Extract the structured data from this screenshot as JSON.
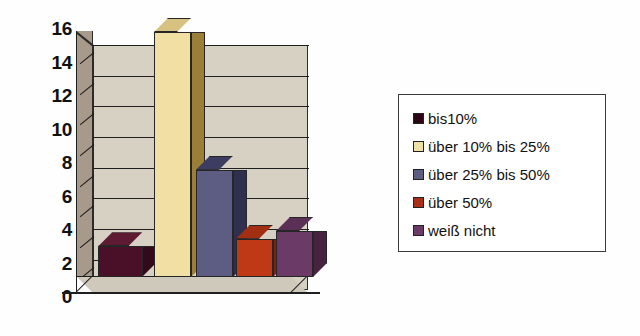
{
  "chart_data": {
    "type": "bar",
    "title": "",
    "subtitle": "",
    "xlabel": "",
    "ylabel": "",
    "ylim": [
      0,
      16
    ],
    "grid": true,
    "style": "3d-bar",
    "legend_position": "right",
    "categories": [
      "bis10%",
      "über 10% bis 25%",
      "über 25% bis 50%",
      "über 50%",
      "weiß nicht"
    ],
    "values": [
      2,
      16,
      7,
      2.5,
      3
    ],
    "yticks": [
      16,
      14,
      12,
      10,
      8,
      6,
      4,
      2,
      0
    ],
    "ytick_labels": [
      "16",
      "14",
      "12",
      "10",
      "8",
      "6",
      "4",
      "2",
      "0"
    ],
    "xtick_labels": [],
    "series": [
      {
        "name": "Anteil",
        "values": [
          2,
          16,
          7,
          2.5,
          3
        ]
      }
    ],
    "bar_colors": [
      "#4a1028",
      "#f1dfa4",
      "#5d5d84",
      "#bf3917",
      "#6b3a66"
    ],
    "bar_side_colors": [
      "#33091b",
      "#9c7f36",
      "#2f3050",
      "#7f2410",
      "#472340"
    ],
    "bar_top_colors": [
      "#5e1a33",
      "#d8c282",
      "#3c3d60",
      "#a32f13",
      "#5a3056"
    ]
  },
  "legend": {
    "items": [
      {
        "label": "bis10%",
        "color": "#2c0614"
      },
      {
        "label": "über 10% bis 25%",
        "color": "#f0e0a8"
      },
      {
        "label": "über 25% bis 50%",
        "color": "#5d5d84"
      },
      {
        "label": "über 50%",
        "color": "#a8301a"
      },
      {
        "label": "weiß nicht",
        "color": "#6b3a66"
      }
    ]
  },
  "axes": {
    "y_tick_labels": [
      "16",
      "14",
      "12",
      "10",
      "8",
      "6",
      "4",
      "2",
      "0"
    ]
  },
  "colors": {
    "plot_wall": "#d7d1c3",
    "plot_side_wall": "#a79a8a",
    "floor": "#cfc9bb",
    "axis": "#1f1f1f",
    "background": "#fefefe"
  }
}
